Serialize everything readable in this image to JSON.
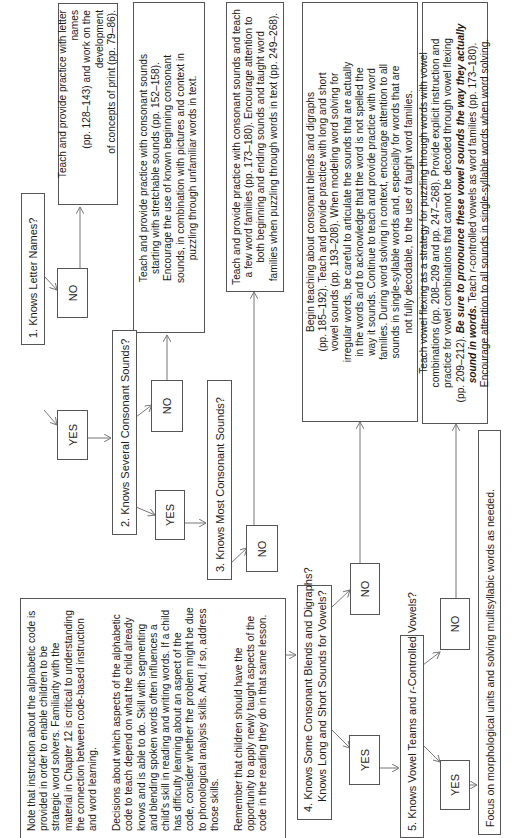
{
  "orientation": "rotated-90-ccw",
  "questions": [
    {
      "label": "1. Knows Letter Names?"
    },
    {
      "label": "2. Knows Several Consonant Sounds?"
    },
    {
      "label": "3. Knows Most Consonant Sounds?"
    },
    {
      "line1": "4. Knows Some Consonant Blends and Digraphs?",
      "line2": "Knows Long and Short Sounds for Vowels?"
    },
    {
      "label_pre": "5. Knows Vowel Teams and ",
      "label_italic": "r",
      "label_post": "-Controlled Vowels?"
    }
  ],
  "answers": {
    "yes": "YES",
    "no": "NO"
  },
  "instructions": {
    "letter_names": [
      "Teach and provide practice with letter names",
      "(pp. 128–143) and work on the development",
      "of concepts of print (pp. 79–86)."
    ],
    "several_consonants": [
      "Teach and provide practice with consonant sounds",
      "starting with stretchable sounds (pp. 152–158).",
      "Encourage the use of known beginning consonant",
      "sounds, in combination with pictures and context in",
      "puzzling through unfamiliar words in text."
    ],
    "most_consonants": [
      "Teach and provide practice with consonant sounds and teach",
      "a few word  families (pp. 173–180). Encourage attention to",
      "both beginning and ending sounds and taught word",
      "families when puzzling through words in text (pp. 249–268)."
    ],
    "blends_digraphs": [
      "Begin teaching about consonant blends and digraphs",
      "(pp. 185–192). Teach and provide practice with long and short",
      "vowel sounds (pp. 193–208). When modeling word solving for",
      "irregular words, be careful to articulate the sounds that are actually",
      "in the words and to acknowledge that the word is not spelled the",
      "way it sounds. Continue to teach and provide practice with word",
      "families. During word solving in context, encourage attention to all",
      "sounds in single-syllable words and, especially for words that are",
      "not fully decodable, to the use of taught word families."
    ],
    "vowel_teams": {
      "line1": "Teach vowel flexing as a strategy for puzzling through words with vowel",
      "line2": "combinations (pp. 208–209 and pp. 247–268). Provide explicit instruction and",
      "line3": "practice for vowel combinations that cannot be decoded through vowel flexing",
      "line4_pre": "(pp. 209–212). ",
      "line4_bold": "Be sure to pronounce these vowel sounds the way they actually",
      "line5_bold": "sound in words.",
      "line5_post_a": " Teach ",
      "line5_italic": "r",
      "line5_post_b": "-controlled vowels as word families (pp. 173–180).",
      "line6": "Encourage attention to all sounds in single-syllable words when word solving."
    },
    "focus": "Focus on morphological units and solving multisyllabic words as needed."
  },
  "note": {
    "paragraphs": [
      "Note that instruction about the alphabetic code is provided in order to enable children to be strategic word solvers. Familiarity with the material in Chapter 12 is critical to understanding the connection between code-based instruction and word learning.",
      "Decisions about which aspects of the alphabetic code to teach depend on what the child already knows and is able to do. Skill with segmenting and blending spoken words often influences a child's skill in reading and writing words. If a child has difficulty learning about an aspect of the code, consider whether the problem might be due to phonological analysis skills. And, if so, address those skills.",
      "Remember that children should have the opportunity to apply newly taught aspects of the code in the reading they do in that same lesson."
    ]
  },
  "colors": {
    "border": "#555555",
    "arrow": "#777777",
    "text": "#1a1a1a"
  }
}
